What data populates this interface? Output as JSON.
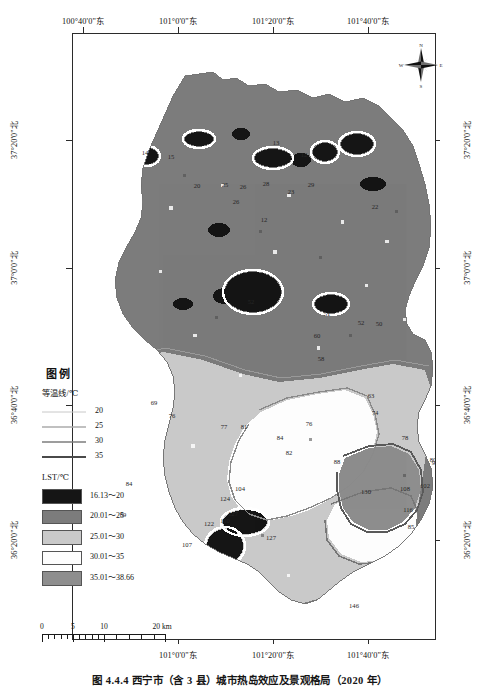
{
  "figure": {
    "caption": "图 4.4.4  西宁市（含 3 县）城市热岛效应及景观格局（2020 年）",
    "width": 480,
    "height": 690
  },
  "map": {
    "title_hidden": "",
    "frame": {
      "left": 72,
      "top": 33,
      "width": 362,
      "height": 605
    },
    "axis_x_top": [
      {
        "label": "100°40'0\"东",
        "x": 83
      },
      {
        "label": "101°0'0\"东",
        "x": 178
      },
      {
        "label": "101°20'0\"东",
        "x": 273
      },
      {
        "label": "101°40'0\"东",
        "x": 368
      }
    ],
    "axis_x_bottom": [
      {
        "label": "101°0'0\"东",
        "x": 178
      },
      {
        "label": "101°20'0\"东",
        "x": 273
      },
      {
        "label": "101°40'0\"东",
        "x": 368
      }
    ],
    "axis_y_left": [
      {
        "label": "37°20'0\"北",
        "y": 140
      },
      {
        "label": "37°0'0\"北",
        "y": 268
      },
      {
        "label": "36°40'0\"北",
        "y": 405
      },
      {
        "label": "36°20'0\"北",
        "y": 540
      }
    ],
    "axis_y_right": [
      {
        "label": "37°20'0\"北",
        "y": 140
      },
      {
        "label": "37°0'0\"北",
        "y": 268
      },
      {
        "label": "36°40'0\"北",
        "y": 405
      },
      {
        "label": "36°20'0\"北",
        "y": 540
      }
    ],
    "compass": {
      "north": "N",
      "south": "S",
      "east": "E",
      "west": "W"
    }
  },
  "legend": {
    "title": "图例",
    "isotherm_heading": "等温线/℃",
    "isotherms": [
      {
        "value": "20",
        "color": "#c8c8c8",
        "weight": 1.0
      },
      {
        "value": "25",
        "color": "#ababab",
        "weight": 1.3
      },
      {
        "value": "30",
        "color": "#7d7d7d",
        "weight": 1.7
      },
      {
        "value": "35",
        "color": "#4a4a4a",
        "weight": 2.2
      }
    ],
    "lst_heading": "LST/℃",
    "classes": [
      {
        "label": "16.13～20",
        "color": "#151515"
      },
      {
        "label": "20.01～25",
        "color": "#7c7c7c"
      },
      {
        "label": "25.01～30",
        "color": "#c9c9c9"
      },
      {
        "label": "30.01～35",
        "color": "#fdfdfd"
      },
      {
        "label": "35.01～38.66",
        "color": "#8e8e8e"
      }
    ]
  },
  "scalebar": {
    "ticks": [
      "0",
      "5",
      "10",
      "20 km"
    ],
    "positions": [
      0,
      25,
      50,
      100
    ]
  },
  "chart_data": {
    "type": "heatmap",
    "variable": "LST",
    "units": "℃",
    "value_range": [
      16.13,
      38.66
    ],
    "classes": [
      {
        "label": "16.13～20",
        "min": 16.13,
        "max": 20.0,
        "color": "#151515"
      },
      {
        "label": "20.01～25",
        "min": 20.01,
        "max": 25.0,
        "color": "#7c7c7c"
      },
      {
        "label": "25.01～30",
        "min": 25.01,
        "max": 30.0,
        "color": "#c9c9c9"
      },
      {
        "label": "30.01～35",
        "min": 30.01,
        "max": 35.0,
        "color": "#fdfdfd"
      },
      {
        "label": "35.01～38.66",
        "min": 35.01,
        "max": 38.66,
        "color": "#8e8e8e"
      }
    ],
    "contour_levels": [
      20,
      25,
      30,
      35
    ],
    "xlabel": "经度",
    "ylabel": "纬度",
    "xlim": [
      "100°40'0\"东",
      "101°50'0\"东"
    ],
    "ylim": [
      "36°10'0\"北",
      "37°30'0\"北"
    ],
    "grid": false,
    "legend_position": "inside-left-lower",
    "contour_labels": [
      {
        "text": "14",
        "x": 144,
        "y": 151
      },
      {
        "text": "15",
        "x": 170,
        "y": 155
      },
      {
        "text": "13",
        "x": 275,
        "y": 141
      },
      {
        "text": "12",
        "x": 303,
        "y": 153
      },
      {
        "text": "20",
        "x": 196,
        "y": 184
      },
      {
        "text": "25",
        "x": 224,
        "y": 183
      },
      {
        "text": "26",
        "x": 242,
        "y": 185
      },
      {
        "text": "28",
        "x": 265,
        "y": 182
      },
      {
        "text": "29",
        "x": 310,
        "y": 183
      },
      {
        "text": "23",
        "x": 290,
        "y": 190
      },
      {
        "text": "12",
        "x": 263,
        "y": 218
      },
      {
        "text": "26",
        "x": 235,
        "y": 200
      },
      {
        "text": "22",
        "x": 374,
        "y": 205
      },
      {
        "text": "52",
        "x": 250,
        "y": 300
      },
      {
        "text": "51",
        "x": 326,
        "y": 312
      },
      {
        "text": "52",
        "x": 360,
        "y": 321
      },
      {
        "text": "50",
        "x": 378,
        "y": 322
      },
      {
        "text": "60",
        "x": 316,
        "y": 334
      },
      {
        "text": "58",
        "x": 320,
        "y": 357
      },
      {
        "text": "69",
        "x": 153,
        "y": 401
      },
      {
        "text": "76",
        "x": 171,
        "y": 414
      },
      {
        "text": "77",
        "x": 223,
        "y": 425
      },
      {
        "text": "81",
        "x": 243,
        "y": 425
      },
      {
        "text": "74",
        "x": 374,
        "y": 411
      },
      {
        "text": "63",
        "x": 370,
        "y": 394
      },
      {
        "text": "76",
        "x": 308,
        "y": 422
      },
      {
        "text": "84",
        "x": 279,
        "y": 436
      },
      {
        "text": "82",
        "x": 288,
        "y": 451
      },
      {
        "text": "78",
        "x": 404,
        "y": 436
      },
      {
        "text": "80",
        "x": 432,
        "y": 458
      },
      {
        "text": "88",
        "x": 336,
        "y": 460
      },
      {
        "text": "108",
        "x": 404,
        "y": 487
      },
      {
        "text": "102",
        "x": 424,
        "y": 484
      },
      {
        "text": "116",
        "x": 407,
        "y": 508
      },
      {
        "text": "130",
        "x": 365,
        "y": 490
      },
      {
        "text": "104",
        "x": 239,
        "y": 487
      },
      {
        "text": "84",
        "x": 128,
        "y": 482
      },
      {
        "text": "89",
        "x": 122,
        "y": 513
      },
      {
        "text": "124",
        "x": 224,
        "y": 497
      },
      {
        "text": "127",
        "x": 232,
        "y": 512
      },
      {
        "text": "110",
        "x": 224,
        "y": 519
      },
      {
        "text": "122",
        "x": 208,
        "y": 522
      },
      {
        "text": "127",
        "x": 270,
        "y": 536
      },
      {
        "text": "107",
        "x": 186,
        "y": 543
      },
      {
        "text": "146",
        "x": 353,
        "y": 604
      },
      {
        "text": "85",
        "x": 410,
        "y": 525
      },
      {
        "text": "90",
        "x": 434,
        "y": 461
      }
    ]
  }
}
